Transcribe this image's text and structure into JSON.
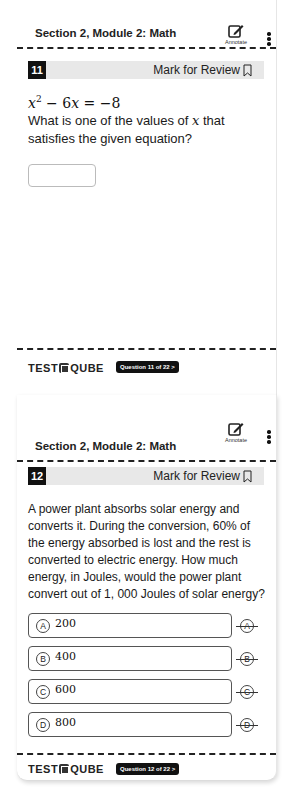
{
  "screens": [
    {
      "header": {
        "section_title": "Section 2, Module 2: Math",
        "annotate_label": "Annotate",
        "more_icon": "vertical-ellipsis"
      },
      "question": {
        "number": "11",
        "mark_for_review": "Mark for Review",
        "equation": "x² − 6x = −8",
        "prompt_part1": "What is one of the values of ",
        "prompt_var": "x",
        "prompt_part2": " that satisfies the given equation?",
        "answer_value": ""
      },
      "footer": {
        "brand": "TESTQUBE",
        "brand_left": "TEST",
        "brand_right": "QUBE",
        "nav_pill": "Question 11 of 22 >"
      }
    },
    {
      "header": {
        "section_title": "Section 2, Module 2: Math",
        "annotate_label": "Annotate",
        "more_icon": "vertical-ellipsis"
      },
      "question": {
        "number": "12",
        "mark_for_review": "Mark for Review",
        "prompt": "A power plant absorbs solar energy and converts it. During the conversion, 60% of the energy absorbed is lost and the rest is converted to electric energy. How much energy, in Joules, would the power plant convert out of 1, 000 Joules of solar energy?",
        "choices": [
          {
            "letter": "A",
            "value": "200"
          },
          {
            "letter": "B",
            "value": "400"
          },
          {
            "letter": "C",
            "value": "600"
          },
          {
            "letter": "D",
            "value": "800"
          }
        ]
      },
      "footer": {
        "brand": "TESTQUBE",
        "brand_left": "TEST",
        "brand_right": "QUBE",
        "nav_pill": "Question 12 of 22 >"
      }
    }
  ]
}
